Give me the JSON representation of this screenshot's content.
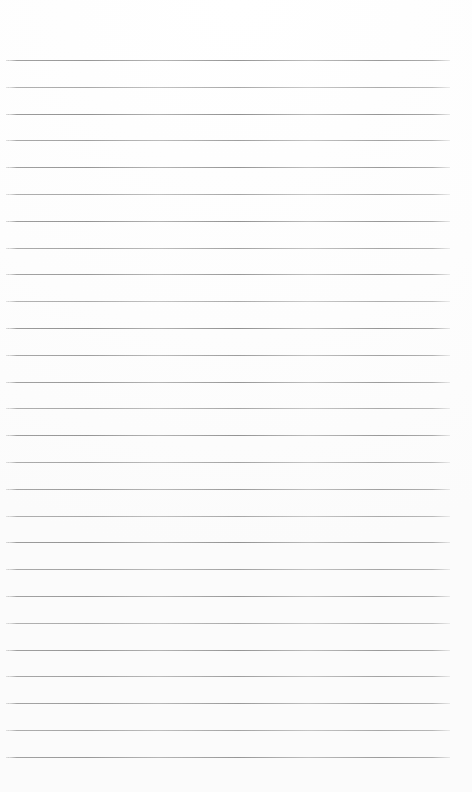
{
  "page": {
    "kind": "blank-ruled-paper-scan",
    "width": 472,
    "height": 792,
    "background_color": "#ffffff",
    "has_text": false,
    "has_vertical_margin_rule": false,
    "text_content": ""
  },
  "ruling": {
    "line_color": "#969696",
    "line_thickness_px": 1,
    "line_count": 27,
    "first_line_y": 60,
    "last_line_y": 756,
    "line_spacing_px": 26.8,
    "line_start_x": 8,
    "line_end_x": 450,
    "line_length_px": 442,
    "top_margin_px": 60,
    "bottom_margin_px": 36,
    "left_margin_px": 8,
    "right_margin_px": 22,
    "lines_y": [
      60,
      86.8,
      113.6,
      140.4,
      167.2,
      194,
      220.8,
      247.6,
      274.4,
      301.2,
      328,
      354.8,
      381.6,
      408.4,
      435.2,
      462,
      488.8,
      515.6,
      542.4,
      569.2,
      596,
      622.8,
      649.6,
      676.4,
      703.2,
      730,
      756.8
    ],
    "line_opacities": [
      0.95,
      0.78,
      1.0,
      0.86,
      0.95,
      0.8,
      0.98,
      0.84,
      0.92,
      0.76,
      1.0,
      0.88,
      0.94,
      0.8,
      0.97,
      0.83,
      0.9,
      0.79,
      0.99,
      0.85,
      0.93,
      0.77,
      0.96,
      0.87,
      0.91,
      0.82,
      0.94
    ]
  },
  "labels": {
    "page_title": "Blank ruled paper",
    "rule_line_name": "ruled-line",
    "top_margin_label": "top margin",
    "bottom_margin_label": "bottom margin"
  }
}
